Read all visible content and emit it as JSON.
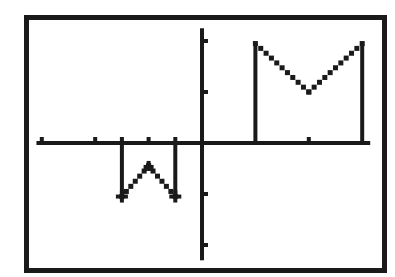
{
  "chart_data": {
    "type": "line",
    "title": "",
    "xlabel": "",
    "ylabel": "",
    "grid": false,
    "legend": "none",
    "style": "monochrome calculator graph screen (pixelated dotted line)",
    "colors": {
      "ink": "#1a1a1a",
      "background": "#ffffff"
    },
    "axes": {
      "x_ticks": [
        -6,
        -4,
        -3,
        -2,
        -1,
        4
      ],
      "y_ticks": [
        4,
        2,
        -2,
        -4
      ],
      "xlim": [
        -6.2,
        6.3
      ],
      "ylim": [
        -4.6,
        4.5
      ],
      "tick_labels_shown": false
    },
    "series": [
      {
        "name": "M shape (upper right)",
        "points": [
          [
            2,
            0
          ],
          [
            2,
            3.9
          ],
          [
            4,
            2
          ],
          [
            6,
            3.9
          ],
          [
            6,
            0
          ]
        ]
      },
      {
        "name": "W shape (lower left)",
        "points": [
          [
            -3,
            0
          ],
          [
            -3,
            -2.1
          ],
          [
            -2,
            -0.9
          ],
          [
            -1,
            -2.1
          ],
          [
            -1,
            0
          ]
        ]
      }
    ]
  },
  "screen": {
    "frame": {
      "x": 24,
      "y": 15,
      "w": 363,
      "h": 258
    },
    "origin_px": {
      "x": 202,
      "y": 143
    },
    "unit_px": {
      "x": 26.7,
      "y": 25.5
    }
  }
}
